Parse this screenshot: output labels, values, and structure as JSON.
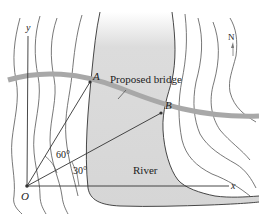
{
  "diagram": {
    "type": "map-geometry",
    "labels": {
      "y_axis": "y",
      "x_axis": "x",
      "origin": "O",
      "point_a": "A",
      "point_b": "B",
      "bridge": "Proposed bridge",
      "river": "River",
      "north": "N",
      "angle_oa": "60°",
      "angle_ob": "30°"
    },
    "angles": {
      "OA_from_x_axis_deg": 60,
      "OB_from_x_axis_deg": 30
    },
    "colors": {
      "river_fill": "#d9d9d9",
      "bridge": "#a8a8a8",
      "lines": "#333333",
      "contours": "#555555",
      "background": "#ffffff"
    }
  }
}
